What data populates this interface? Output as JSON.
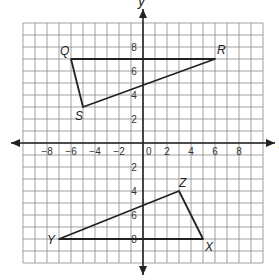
{
  "diagram": {
    "axes": {
      "x_label": "x",
      "y_label": "y",
      "range": [
        -10,
        10
      ]
    },
    "x_ticks": [
      "−8",
      "−6",
      "−4",
      "−2",
      "0",
      "2",
      "4",
      "6",
      "8"
    ],
    "y_ticks": [
      "8",
      "6",
      "4",
      "2",
      "2",
      "4",
      "6",
      "8"
    ],
    "shapes": [
      {
        "name": "triangle QRS",
        "vertices": [
          {
            "label": "Q",
            "x": -6,
            "y": 7
          },
          {
            "label": "R",
            "x": 6,
            "y": 7
          },
          {
            "label": "S",
            "x": -5,
            "y": 3
          }
        ]
      },
      {
        "name": "triangle XYZ",
        "vertices": [
          {
            "label": "Z",
            "x": 3,
            "y": -4
          },
          {
            "label": "X",
            "x": 5,
            "y": -8
          },
          {
            "label": "Y",
            "x": -7,
            "y": -8
          }
        ]
      }
    ]
  },
  "style": {
    "grid_color": "#8a8a8a",
    "line_color": "#222222",
    "background": "#ffffff"
  }
}
